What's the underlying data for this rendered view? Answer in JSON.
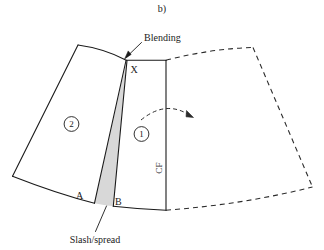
{
  "figure": {
    "caption": "b)",
    "type": "technical-pattern-drafting-diagram",
    "labels": {
      "blending": "Blending",
      "slash_spread": "Slash/spread",
      "point_x": "X",
      "point_a": "A",
      "point_b": "B",
      "piece_one": "1",
      "piece_two": "2",
      "center_front": "CF"
    },
    "colors": {
      "line": "#1a1a1a",
      "wedge_fill": "#d8d8d8",
      "background": "#ffffff",
      "dashed_line": "#2b2b2b"
    },
    "geometry": {
      "panel_two_outline": "M 78 45 L 12 176 L 12.5 176.5 Q 70 198 110 205",
      "panel_two_top_curve": "M 78 45 Q 108 50 126 60",
      "slash_line_left": "M 126 61 L 94 203",
      "slash_line_right": "M 127 61 L 113 206",
      "wedge_fill_path": "M 126.5 61 L 94 203 Q 104 205 113 206 Z",
      "panel_one_top": "M 126 60 L 166 60",
      "panel_one_cf": "M 166 60 L 166 210",
      "panel_one_bottom_arc": "M 110 205 Q 140 209 166 210",
      "mirror_top_curve": "M 166 60 Q 212 50 253 48",
      "mirror_right_edge": "M 253 48 L 312 187",
      "mirror_bottom_arc": "M 166 210 Q 240 205 312 187",
      "rotation_arrow": "M 142 119 Q 166 100 192 117",
      "blending_leader": "M 140 44 L 124 58",
      "slash_leader": "M 95 234 L 106 207"
    }
  }
}
